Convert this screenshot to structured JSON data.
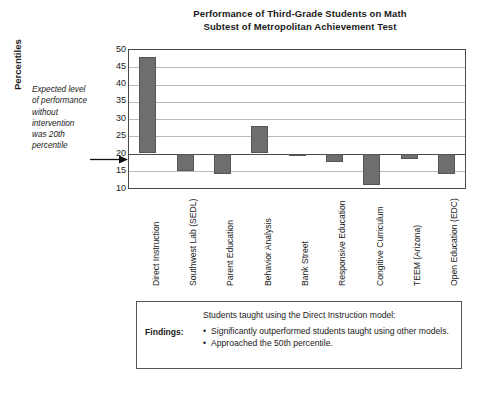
{
  "chart_data": {
    "type": "bar",
    "title": "Performance of Third-Grade Students on Math Subtest of Metropolitan Achievement Test",
    "title_line1": "Performance of Third-Grade Students on Math",
    "title_line2": "Subtest of Metropolitan Achievement Test",
    "xlabel": "",
    "ylabel": "Percentiles",
    "ylim": [
      10,
      50
    ],
    "ytick_labels": [
      "50",
      "45",
      "40",
      "35",
      "30",
      "25",
      "20",
      "15",
      "10"
    ],
    "yticks": [
      50,
      45,
      40,
      35,
      30,
      25,
      20,
      15,
      10
    ],
    "grid": true,
    "legend": "none",
    "baseline": 20,
    "categories": [
      "Direct Instruction",
      "Southwest Lab (SEDL)",
      "Parent Education",
      "Behavior Analysis",
      "Bank Street",
      "Responsive Education",
      "Congitive Curriculum",
      "TEEM (Arizona)",
      "Open Education (EDC)"
    ],
    "values": [
      48,
      15,
      14,
      28,
      19.5,
      17.5,
      11,
      18.5,
      14
    ],
    "bar_color": "#6e6e6e",
    "annotations": [
      {
        "text": "Expected level of performance without intervention was 20th percentile",
        "target_value": 20
      }
    ]
  },
  "annotation": {
    "lines": [
      "Expected level",
      "of performance",
      "without",
      "intervention",
      "was 20th",
      "percentile"
    ]
  },
  "axis": {
    "y_caption": "Percentiles"
  },
  "findings": {
    "label": "Findings:",
    "intro": "Students taught using the Direct Instruction model:",
    "bullet_glyph": "•",
    "items": [
      "Significantly outperformed students taught using other models.",
      "Approached the 50th percentile."
    ]
  }
}
